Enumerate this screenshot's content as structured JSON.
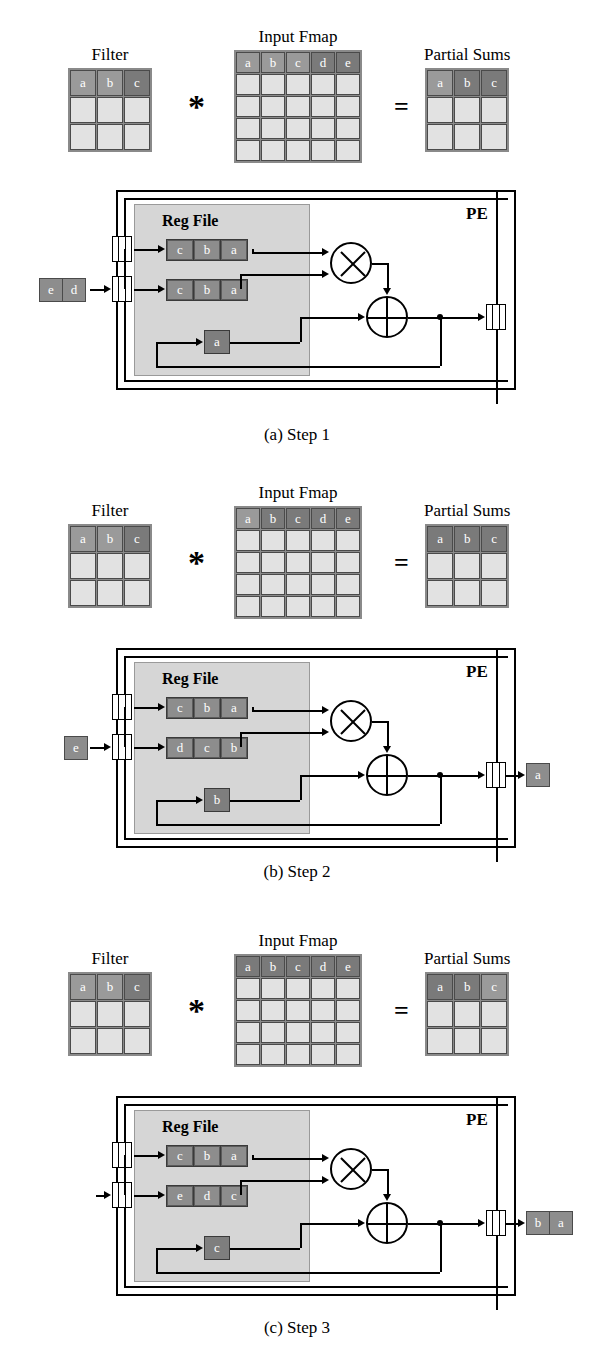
{
  "labels": {
    "filter": "Filter",
    "input_fmap": "Input Fmap",
    "partial_sums": "Partial Sums",
    "mult_op": "*",
    "equals_op": "=",
    "reg_file": "Reg File",
    "pe": "PE"
  },
  "steps": [
    {
      "id": "step1",
      "caption": "(a) Step 1",
      "filter": {
        "rows": 3,
        "cols": 3,
        "top_row": [
          "a",
          "b",
          "c"
        ],
        "highlight": [
          "lit",
          "lit",
          "lit2"
        ]
      },
      "ifmap": {
        "rows": 5,
        "cols": 5,
        "top_row": [
          "a",
          "b",
          "c",
          "d",
          "e"
        ],
        "highlight": [
          "lit",
          "lit",
          "lit",
          "lit2",
          "lit2"
        ]
      },
      "psum": {
        "rows": 3,
        "cols": 3,
        "top_row": [
          "a",
          "b",
          "c"
        ],
        "highlight": [
          "lit",
          "lit2",
          "lit2"
        ]
      },
      "pe": {
        "input_cells": [
          "e",
          "d"
        ],
        "reg_row_top": [
          "c",
          "b",
          "a"
        ],
        "reg_row_bottom": [
          "c",
          "b",
          "a"
        ],
        "accumulator": "a",
        "output_cells": []
      }
    },
    {
      "id": "step2",
      "caption": "(b) Step 2",
      "filter": {
        "rows": 3,
        "cols": 3,
        "top_row": [
          "a",
          "b",
          "c"
        ],
        "highlight": [
          "lit",
          "lit",
          "lit2"
        ]
      },
      "ifmap": {
        "rows": 5,
        "cols": 5,
        "top_row": [
          "a",
          "b",
          "c",
          "d",
          "e"
        ],
        "highlight": [
          "lit",
          "lit2",
          "lit2",
          "lit2",
          "lit2"
        ]
      },
      "psum": {
        "rows": 3,
        "cols": 3,
        "top_row": [
          "a",
          "b",
          "c"
        ],
        "highlight": [
          "lit2",
          "lit2",
          "lit2"
        ]
      },
      "pe": {
        "input_cells": [
          "e"
        ],
        "reg_row_top": [
          "c",
          "b",
          "a"
        ],
        "reg_row_bottom": [
          "d",
          "c",
          "b"
        ],
        "accumulator": "b",
        "output_cells": [
          "a"
        ]
      }
    },
    {
      "id": "step3",
      "caption": "(c) Step 3",
      "filter": {
        "rows": 3,
        "cols": 3,
        "top_row": [
          "a",
          "b",
          "c"
        ],
        "highlight": [
          "lit",
          "lit",
          "lit2"
        ]
      },
      "ifmap": {
        "rows": 5,
        "cols": 5,
        "top_row": [
          "a",
          "b",
          "c",
          "d",
          "e"
        ],
        "highlight": [
          "lit2",
          "lit2",
          "lit2",
          "lit2",
          "lit2"
        ]
      },
      "psum": {
        "rows": 3,
        "cols": 3,
        "top_row": [
          "a",
          "b",
          "c"
        ],
        "highlight": [
          "lit2",
          "lit2",
          "lit"
        ]
      },
      "pe": {
        "input_cells": [],
        "reg_row_top": [
          "c",
          "b",
          "a"
        ],
        "reg_row_bottom": [
          "e",
          "d",
          "c"
        ],
        "accumulator": "c",
        "output_cells": [
          "b",
          "a"
        ]
      }
    }
  ],
  "colors": {
    "grid_fill": "#e2e2e2",
    "grid_highlight_light": "#9a9a9a",
    "grid_highlight_dark": "#7a7a7a",
    "reg_cell": "#8d8d8d",
    "regfile_bg": "#d6d6d6",
    "line": "#000000"
  }
}
